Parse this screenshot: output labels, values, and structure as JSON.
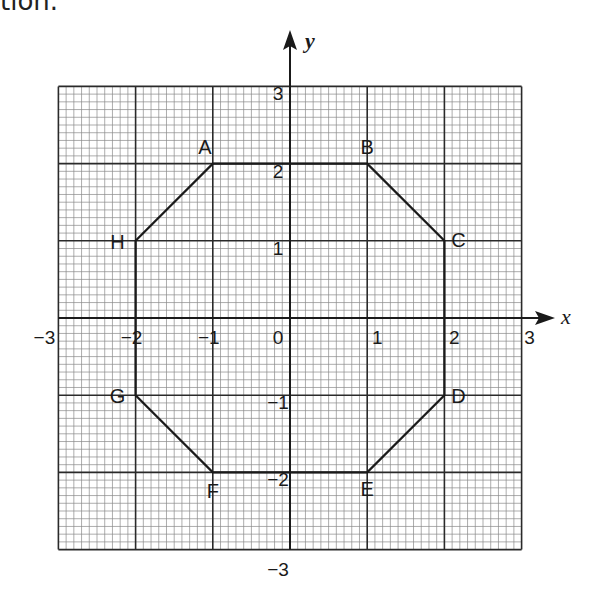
{
  "caption": "tion.",
  "graph": {
    "x_axis_label": "x",
    "y_axis_label": "y",
    "x_range": [
      -3,
      3
    ],
    "y_range": [
      -3,
      3
    ],
    "major_step": 1,
    "minor_divisions": 10,
    "x_ticks": [
      "−3",
      "−2",
      "−1",
      "0",
      "1",
      "2",
      "3"
    ],
    "y_ticks": [
      "3",
      "2",
      "1",
      "−1",
      "−2",
      "−3"
    ],
    "origin_label": "0"
  },
  "octagon": {
    "vertices": [
      {
        "label": "A",
        "x": -1,
        "y": 2
      },
      {
        "label": "B",
        "x": 1,
        "y": 2
      },
      {
        "label": "C",
        "x": 2,
        "y": 1
      },
      {
        "label": "D",
        "x": 2,
        "y": -1
      },
      {
        "label": "E",
        "x": 1,
        "y": -2
      },
      {
        "label": "F",
        "x": -1,
        "y": -2
      },
      {
        "label": "G",
        "x": -2,
        "y": -1
      },
      {
        "label": "H",
        "x": -2,
        "y": 1
      }
    ]
  },
  "colors": {
    "ink": "#1a1a1a",
    "minor_grid": "#8a8a8a",
    "major_grid": "#2a2a2a"
  }
}
